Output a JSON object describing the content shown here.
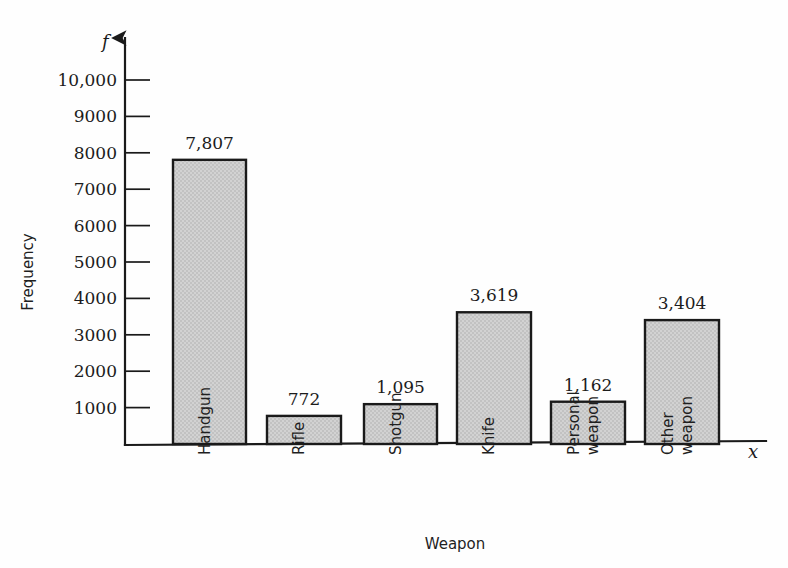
{
  "chart_data": {
    "type": "bar",
    "title": "",
    "xlabel": "Weapon",
    "ylabel": "Frequency",
    "x_axis_variable": "x",
    "y_axis_variable": "f",
    "categories": [
      "Handgun",
      "Rifle",
      "Shotgun",
      "Knife",
      "Personal weapon",
      "Other weapon"
    ],
    "values": [
      7807,
      772,
      1095,
      3619,
      1162,
      3404
    ],
    "value_labels": [
      "7,807",
      "772",
      "1,095",
      "1,162",
      "3,619",
      "3,404"
    ],
    "ylim": [
      0,
      10000
    ],
    "ytick_values": [
      1000,
      2000,
      3000,
      4000,
      5000,
      6000,
      7000,
      8000,
      9000,
      10000
    ],
    "ytick_labels": [
      "1000",
      "2000",
      "3000",
      "4000",
      "5000",
      "6000",
      "7000",
      "8000",
      "9000",
      "10,000"
    ],
    "grid": false,
    "legend": false,
    "legend_position": "none",
    "bars": [
      {
        "category": "Handgun",
        "category_lines": [
          "Handgun"
        ],
        "value": 7807,
        "label": "7,807"
      },
      {
        "category": "Rifle",
        "category_lines": [
          "Rifle"
        ],
        "value": 772,
        "label": "772"
      },
      {
        "category": "Shotgun",
        "category_lines": [
          "Shotgun"
        ],
        "value": 1095,
        "label": "1,095"
      },
      {
        "category": "Knife",
        "category_lines": [
          "Knife"
        ],
        "value": 3619,
        "label": "3,619"
      },
      {
        "category": "Personal weapon",
        "category_lines": [
          "Personal",
          "weapon"
        ],
        "value": 1162,
        "label": "1,162"
      },
      {
        "category": "Other weapon",
        "category_lines": [
          "Other",
          "weapon"
        ],
        "value": 3404,
        "label": "3,404"
      }
    ]
  },
  "style": {
    "bar_fill": "#cccccc",
    "bar_stroke": "#1a1a1a",
    "axis_color": "#1a1a1a",
    "text_color": "#1c1c1c",
    "background": "#fefefe"
  }
}
